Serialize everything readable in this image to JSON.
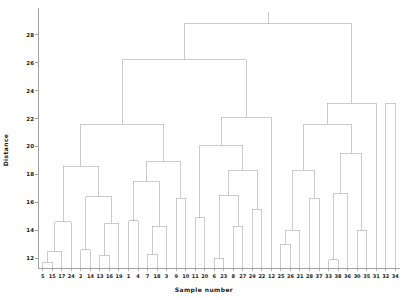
{
  "chart_data": {
    "type": "dendrogram",
    "title": "",
    "xlabel": "Sample number",
    "ylabel": "Distance",
    "grid": false,
    "legend": "none",
    "ylim": [
      11.3,
      29.2
    ],
    "yticks": [
      12,
      14,
      16,
      18,
      20,
      22,
      24,
      26,
      28
    ],
    "ytick_labels": [
      "12",
      "14",
      "16",
      "18",
      "20",
      "22",
      "24",
      "26",
      "28"
    ],
    "leaf_labels": [
      "5",
      "15",
      "17",
      "24",
      "2",
      "14",
      "13",
      "16",
      "19",
      "1",
      "4",
      "7",
      "18",
      "3",
      "9",
      "10",
      "11",
      "20",
      "6",
      "23",
      "8",
      "27",
      "29",
      "22",
      "12",
      "25",
      "26",
      "21",
      "28",
      "37",
      "33",
      "38",
      "36",
      "30",
      "35",
      "31",
      "32",
      "34"
    ],
    "n_leaves": 38,
    "line_color": "#a8a8a8",
    "axis_color": "#8c8c8c",
    "links": [
      {
        "id": "L1",
        "left": "5",
        "right": "15",
        "height": 11.7
      },
      {
        "id": "L2",
        "left": "L1",
        "right": "17",
        "height": 12.5
      },
      {
        "id": "L3",
        "left": "L2",
        "right": "24",
        "height": 14.6
      },
      {
        "id": "L4",
        "left": "2",
        "right": "14",
        "height": 12.6
      },
      {
        "id": "L5",
        "left": "13",
        "right": "16",
        "height": 12.2
      },
      {
        "id": "L6",
        "left": "L5",
        "right": "19",
        "height": 14.5
      },
      {
        "id": "L7",
        "left": "L4",
        "right": "L6",
        "height": 16.4
      },
      {
        "id": "L8",
        "left": "L3",
        "right": "L7",
        "height": 18.6
      },
      {
        "id": "L9",
        "left": "1",
        "right": "4",
        "height": 14.7
      },
      {
        "id": "L10",
        "left": "7",
        "right": "18",
        "height": 12.3
      },
      {
        "id": "L11",
        "left": "L10",
        "right": "3",
        "height": 14.3
      },
      {
        "id": "L12",
        "left": "L9",
        "right": "L11",
        "height": 17.5
      },
      {
        "id": "L13",
        "left": "9",
        "right": "10",
        "height": 16.3
      },
      {
        "id": "L14",
        "left": "L12",
        "right": "L13",
        "height": 18.9
      },
      {
        "id": "L15",
        "left": "L8",
        "right": "L14",
        "height": 21.6
      },
      {
        "id": "L16",
        "left": "11",
        "right": "20",
        "height": 14.9
      },
      {
        "id": "L17",
        "left": "6",
        "right": "23",
        "height": 12.0
      },
      {
        "id": "L18",
        "left": "8",
        "right": "27",
        "height": 14.3
      },
      {
        "id": "L19",
        "left": "L17",
        "right": "L18",
        "height": 16.5
      },
      {
        "id": "L20",
        "left": "29",
        "right": "22",
        "height": 15.5
      },
      {
        "id": "L21",
        "left": "L19",
        "right": "L20",
        "height": 18.3
      },
      {
        "id": "L22",
        "left": "L16",
        "right": "L21",
        "height": 20.1
      },
      {
        "id": "L23",
        "left": "L22",
        "right": "12",
        "height": 22.1
      },
      {
        "id": "L24",
        "left": "L15",
        "right": "L23",
        "height": 26.2
      },
      {
        "id": "L25",
        "left": "25",
        "right": "26",
        "height": 13.0
      },
      {
        "id": "L26",
        "left": "L25",
        "right": "21",
        "height": 14.0
      },
      {
        "id": "L27",
        "left": "28",
        "right": "37",
        "height": 16.3
      },
      {
        "id": "L28",
        "left": "L26",
        "right": "L27",
        "height": 18.3
      },
      {
        "id": "L29",
        "left": "33",
        "right": "38",
        "height": 11.9
      },
      {
        "id": "L30",
        "left": "L29",
        "right": "36",
        "height": 16.6
      },
      {
        "id": "L31",
        "left": "30",
        "right": "35",
        "height": 14.0
      },
      {
        "id": "L32",
        "left": "L30",
        "right": "L31",
        "height": 19.5
      },
      {
        "id": "L33",
        "left": "L28",
        "right": "L32",
        "height": 21.6
      },
      {
        "id": "L34",
        "left": "L33",
        "right": "31",
        "height": 23.1
      },
      {
        "id": "L35",
        "left": "32",
        "right": "34",
        "height": 23.1
      },
      {
        "id": "L36",
        "left": "L24",
        "right": "L34",
        "height": 28.8
      }
    ]
  }
}
